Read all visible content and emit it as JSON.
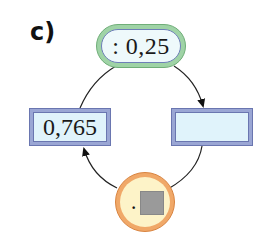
{
  "exercise": {
    "label": "c)"
  },
  "diagram": {
    "top_operator": {
      "text": ": 0,25",
      "shape": "oval",
      "outer_color": "#9fd3a6",
      "inner_color": "#eef9fb"
    },
    "left_box": {
      "value": "0,765",
      "fill_color": "#e0f3fb",
      "border_color": "#9aa6d4"
    },
    "right_box": {
      "value": "",
      "fill_color": "#e0f3fb",
      "border_color": "#9aa6d4"
    },
    "bottom_operator": {
      "operator_symbol": "·",
      "placeholder": "gray-square",
      "shape": "circle",
      "outer_color": "#f0a868",
      "inner_color": "#fdf3c8"
    },
    "arrows": [
      {
        "from": "left_box",
        "via": "top_operator",
        "to": "right_box"
      },
      {
        "from": "right_box",
        "via": "bottom_operator",
        "to": "left_box"
      }
    ]
  }
}
